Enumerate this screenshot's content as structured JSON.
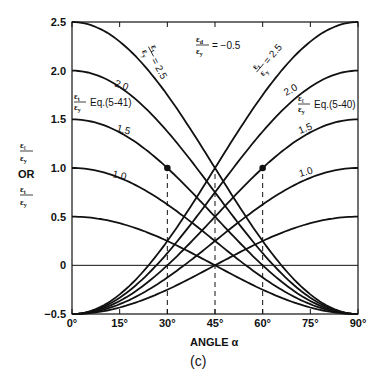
{
  "chart_data": {
    "type": "line",
    "title": "",
    "subtitle": "(c)",
    "xlabel": "ANGLE α",
    "ylabel": "εℓ/εy OR εt/εy",
    "xlim": [
      0,
      90
    ],
    "ylim": [
      -0.5,
      2.5
    ],
    "x_ticks": [
      "0°",
      "15°",
      "30°",
      "45°",
      "60°",
      "75°",
      "90°"
    ],
    "x_tick_values": [
      0,
      15,
      30,
      45,
      60,
      75,
      90
    ],
    "y_ticks": [
      "-0.5",
      "0",
      "0.5",
      "1.0",
      "1.5",
      "2.0",
      "2.5"
    ],
    "y_tick_values": [
      -0.5,
      0,
      0.5,
      1.0,
      1.5,
      2.0,
      2.5
    ],
    "grid": false,
    "reference_line_y": 0,
    "parameter": {
      "name": "εd/εy",
      "value": -0.5,
      "label": "= -0.5"
    },
    "families": [
      {
        "name": "εt/εy Eq.(5-41)",
        "formula": "A·cos²α + (εd/εy)·sin²α",
        "direction": "descending",
        "A_values": [
          0.5,
          1.0,
          1.5,
          2.0,
          2.5
        ],
        "labels": [
          "",
          "1.0",
          "1.5",
          "2.0",
          "= 2.5"
        ]
      },
      {
        "name": "εℓ/εy Eq.(5-40)",
        "formula": "A·sin²α + (εd/εy)·cos²α",
        "direction": "ascending",
        "A_values": [
          0.5,
          1.0,
          1.5,
          2.0,
          2.5
        ],
        "labels": [
          "",
          "1.0",
          "1.5",
          "2.0",
          "= 2.5"
        ]
      }
    ],
    "series": [
      {
        "name": "descending A=0.5",
        "x": [
          0,
          15,
          30,
          45,
          60,
          75,
          90
        ],
        "values": [
          0.5,
          0.43,
          0.25,
          0.0,
          -0.25,
          -0.43,
          -0.5
        ]
      },
      {
        "name": "descending A=1.0",
        "x": [
          0,
          15,
          30,
          45,
          60,
          75,
          90
        ],
        "values": [
          1.0,
          0.9,
          0.63,
          0.25,
          -0.13,
          -0.4,
          -0.5
        ]
      },
      {
        "name": "descending A=1.5",
        "x": [
          0,
          15,
          30,
          45,
          60,
          75,
          90
        ],
        "values": [
          1.5,
          1.37,
          1.0,
          0.5,
          0.0,
          -0.37,
          -0.5
        ]
      },
      {
        "name": "descending A=2.0",
        "x": [
          0,
          15,
          30,
          45,
          60,
          75,
          90
        ],
        "values": [
          2.0,
          1.83,
          1.38,
          0.75,
          0.13,
          -0.33,
          -0.5
        ]
      },
      {
        "name": "descending A=2.5",
        "x": [
          0,
          15,
          30,
          45,
          60,
          75,
          90
        ],
        "values": [
          2.5,
          2.3,
          1.75,
          1.0,
          0.25,
          -0.3,
          -0.5
        ]
      },
      {
        "name": "ascending A=0.5",
        "x": [
          0,
          15,
          30,
          45,
          60,
          75,
          90
        ],
        "values": [
          -0.5,
          -0.43,
          -0.25,
          0.0,
          0.25,
          0.43,
          0.5
        ]
      },
      {
        "name": "ascending A=1.0",
        "x": [
          0,
          15,
          30,
          45,
          60,
          75,
          90
        ],
        "values": [
          -0.5,
          -0.4,
          -0.13,
          0.25,
          0.63,
          0.9,
          1.0
        ]
      },
      {
        "name": "ascending A=1.5",
        "x": [
          0,
          15,
          30,
          45,
          60,
          75,
          90
        ],
        "values": [
          -0.5,
          -0.37,
          0.0,
          0.5,
          1.0,
          1.37,
          1.5
        ]
      },
      {
        "name": "ascending A=2.0",
        "x": [
          0,
          15,
          30,
          45,
          60,
          75,
          90
        ],
        "values": [
          -0.5,
          -0.33,
          0.13,
          0.75,
          1.38,
          1.83,
          2.0
        ]
      },
      {
        "name": "ascending A=2.5",
        "x": [
          0,
          15,
          30,
          45,
          60,
          75,
          90
        ],
        "values": [
          -0.5,
          -0.3,
          0.25,
          1.0,
          1.75,
          2.3,
          2.5
        ]
      }
    ],
    "markers": [
      {
        "x": 30,
        "y": 1.0,
        "on": "descending A=1.5"
      },
      {
        "x": 60,
        "y": 1.0,
        "on": "ascending A=1.5"
      }
    ],
    "dashed_verticals": [
      {
        "x": 30,
        "from_y": -0.5,
        "to_y": 1.0
      },
      {
        "x": 45,
        "from_y": -0.5,
        "to_y": 1.0
      },
      {
        "x": 60,
        "from_y": -0.5,
        "to_y": 1.0
      }
    ],
    "annotations": {
      "param_label": "εd/εy = -0.5",
      "left_eq": "Eq.(5-41)",
      "right_eq": "Eq.(5-40)",
      "y_label_top": "εℓ / εy",
      "y_label_or": "OR",
      "y_label_bottom": "εt / εy"
    }
  },
  "text": {
    "or": "OR",
    "eps": "ε",
    "sub_l": "ℓ",
    "sub_t": "t",
    "sub_y": "y",
    "sub_d": "d",
    "param_value": "= −0.5",
    "eq_left": "Eq.(5-41)",
    "eq_right": "Eq.(5-40)",
    "eq25": "= 2.5",
    "xlabel": "ANGLE α",
    "subtitle": "(c)"
  }
}
